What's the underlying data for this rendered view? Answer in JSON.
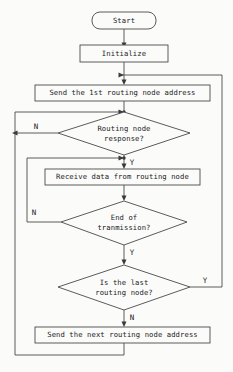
{
  "diagram": {
    "type": "flowchart",
    "canvas": {
      "width": 233,
      "height": 372
    },
    "colors": {
      "background": "#fbfbfa",
      "stroke": "#4a4a4a",
      "text": "#1a1a1a",
      "arrow": "#3a3a3a"
    },
    "nodes": [
      {
        "id": "start",
        "shape": "terminator",
        "label": "Start",
        "lines": [
          "Start"
        ]
      },
      {
        "id": "initialize",
        "shape": "process",
        "label": "Initialize",
        "lines": [
          "Initialize"
        ]
      },
      {
        "id": "send-first",
        "shape": "process",
        "label": "Send the 1st routing node address",
        "lines": [
          "Send the 1st routing node address"
        ]
      },
      {
        "id": "routing-node-response",
        "shape": "decision",
        "label": "Routing node response?",
        "lines": [
          "Routing node",
          "response?"
        ]
      },
      {
        "id": "receive-data",
        "shape": "process",
        "label": "Receive data from routing node",
        "lines": [
          "Receive data from routing node"
        ]
      },
      {
        "id": "end-of-transmission",
        "shape": "decision",
        "label": "End of tranmission?",
        "lines": [
          "End of",
          "tranmission?"
        ]
      },
      {
        "id": "is-last-routing-node",
        "shape": "decision",
        "label": "Is the last routing node?",
        "lines": [
          "Is the last",
          "routing node?"
        ]
      },
      {
        "id": "send-next",
        "shape": "process",
        "label": "Send the next routing node address",
        "lines": [
          "Send the next routing node address"
        ]
      }
    ],
    "branch_labels": {
      "response_no": "N",
      "response_yes": "Y",
      "transmission_no": "N",
      "transmission_yes": "Y",
      "last_node_yes": "Y",
      "last_node_no": "N"
    }
  }
}
